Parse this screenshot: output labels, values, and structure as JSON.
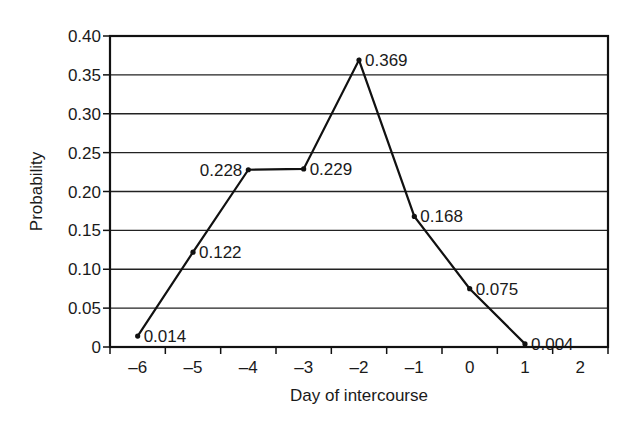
{
  "chart_data": {
    "type": "line",
    "title": "",
    "xlabel": "Day of intercourse",
    "ylabel": "Probability",
    "x_categories": [
      "-6",
      "-5",
      "-4",
      "-3",
      "-2",
      "-1",
      "0",
      "1",
      "2"
    ],
    "xlim": [
      -6.5,
      2.5
    ],
    "ylim": [
      0,
      0.4
    ],
    "y_ticks": [
      0,
      0.05,
      0.1,
      0.15,
      0.2,
      0.25,
      0.3,
      0.35,
      0.4
    ],
    "y_tick_labels": [
      "0",
      "0.05",
      "0.10",
      "0.15",
      "0.20",
      "0.25",
      "0.30",
      "0.35",
      "0.40"
    ],
    "grid": "horizontal",
    "legend": "none",
    "series": [
      {
        "name": "Probability",
        "color": "#111111",
        "points": [
          {
            "x": -6,
            "y": 0.014,
            "label": "0.014",
            "label_pos": "right"
          },
          {
            "x": -5,
            "y": 0.122,
            "label": "0.122",
            "label_pos": "right"
          },
          {
            "x": -4,
            "y": 0.228,
            "label": "0.228",
            "label_pos": "left"
          },
          {
            "x": -3,
            "y": 0.229,
            "label": "0.229",
            "label_pos": "right"
          },
          {
            "x": -2,
            "y": 0.369,
            "label": "0.369",
            "label_pos": "right"
          },
          {
            "x": -1,
            "y": 0.168,
            "label": "0.168",
            "label_pos": "right"
          },
          {
            "x": 0,
            "y": 0.075,
            "label": "0.075",
            "label_pos": "right"
          },
          {
            "x": 1,
            "y": 0.004,
            "label": "0.004",
            "label_pos": "right"
          }
        ]
      }
    ]
  }
}
